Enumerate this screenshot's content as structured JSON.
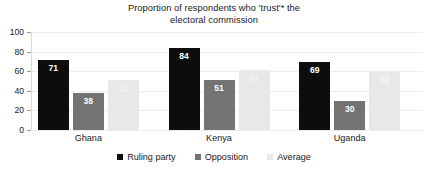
{
  "chart_data": {
    "type": "bar",
    "title": "Proportion of respondents who 'trust'* the electoral commission",
    "title_line1": "Proportion of respondents who 'trust'* the",
    "title_line2": "electoral commission",
    "xlabel": "",
    "ylabel": "",
    "ylim": [
      0,
      100
    ],
    "yticks": [
      0,
      20,
      40,
      60,
      80,
      100
    ],
    "ytick_labels": [
      "0",
      "20",
      "40",
      "60",
      "80",
      "100"
    ],
    "grid": true,
    "legend_position": "bottom",
    "categories": [
      "Ghana",
      "Kenya",
      "Uganda"
    ],
    "series": [
      {
        "name": "Ruling party",
        "color": "#0d0d0d",
        "values": [
          71,
          84,
          69
        ],
        "labels": [
          "71",
          "84",
          "69"
        ]
      },
      {
        "name": "Opposition",
        "color": "#737373",
        "values": [
          38,
          51,
          30
        ],
        "labels": [
          "38",
          "51",
          "30"
        ]
      },
      {
        "name": "Average",
        "color": "#e8e8e8",
        "values": [
          51,
          61,
          59
        ],
        "labels": [
          "51",
          "61",
          "59"
        ]
      }
    ]
  }
}
